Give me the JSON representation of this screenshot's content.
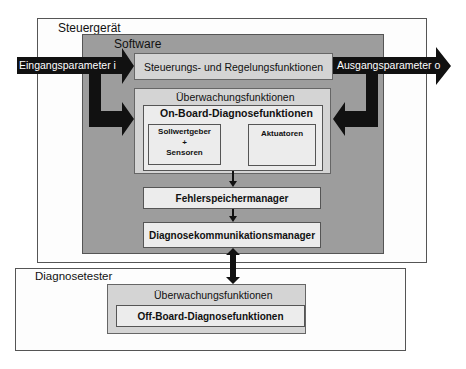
{
  "diagram": {
    "steuergeraet": {
      "title": "Steuergerät",
      "software": {
        "title": "Software",
        "steuerung_box": "Steuerungs- und Regelungsfunktionen",
        "ueberwachung": {
          "title": "Überwachungsfunktionen",
          "onboard": {
            "title": "On-Board-Diagnosefunktionen",
            "sensoren_line1": "Sollwertgeber",
            "sensoren_line2": "+",
            "sensoren_line3": "Sensoren",
            "aktuatoren": "Aktuatoren"
          }
        },
        "fehlerspeicher": "Fehlerspeichermanager",
        "diagnosekomm": "Diagnosekommunikationsmanager"
      }
    },
    "input_arrow": "Eingangsparameter i",
    "output_arrow": "Ausgangsparameter o",
    "diagnosetester": {
      "title": "Diagnosetester",
      "ueberwachung": "Überwachungsfunktionen",
      "offboard": "Off-Board-Diagnosefunktionen"
    },
    "colors": {
      "software_gray": "#9d9d9d",
      "inner_light_gray": "#d4d4d4",
      "arrow_black": "#111111"
    }
  }
}
